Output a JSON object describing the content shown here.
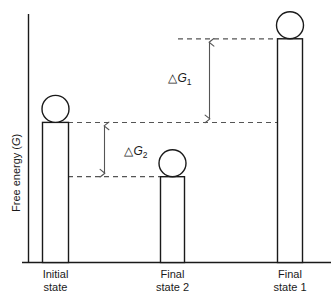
{
  "figure": {
    "title": "",
    "axis": {
      "ylabel": "Free energy (G)",
      "ylabel_italic_part": "G"
    },
    "annotations": {
      "delta_g1": {
        "delta": "△",
        "base": "G",
        "sub": "1"
      },
      "delta_g2": {
        "delta": "△",
        "base": "G",
        "sub": "2"
      }
    },
    "colors": {
      "stroke": "#1a1a1a",
      "dashed": "#555555",
      "arrow": "#555555",
      "background": "#ffffff"
    }
  },
  "chart_data": {
    "type": "bar",
    "title": "",
    "xlabel": "",
    "ylabel": "Free energy (G)",
    "categories": [
      "Initial state",
      "Final state 2",
      "Final state 1"
    ],
    "category_lines": [
      [
        "Initial",
        "state"
      ],
      [
        "Final",
        "state 2"
      ],
      [
        "Final",
        "state 1"
      ]
    ],
    "values": [
      62,
      38,
      99
    ],
    "ylim": [
      0,
      110
    ],
    "grid": false,
    "legend": null,
    "marker": "circle-on-top-of-bar",
    "annotations": [
      {
        "label": "△G₁",
        "from_category": "Final state 1",
        "to_category": "Initial state",
        "from_value": 99,
        "to_value": 62,
        "magnitude": 37,
        "direction": "double-headed-vertical"
      },
      {
        "label": "△G₂",
        "from_category": "Initial state",
        "to_category": "Final state 2",
        "from_value": 62,
        "to_value": 38,
        "magnitude": 24,
        "direction": "double-headed-vertical"
      }
    ],
    "reference_lines": [
      {
        "at_value": 99,
        "style": "dashed",
        "from_category": "annotation",
        "to_category": "Final state 1"
      },
      {
        "at_value": 62,
        "style": "dashed",
        "from_category": "Initial state",
        "to_category": "Final state 1"
      },
      {
        "at_value": 38,
        "style": "dashed",
        "from_category": "Initial state",
        "to_category": "Final state 2"
      }
    ]
  }
}
